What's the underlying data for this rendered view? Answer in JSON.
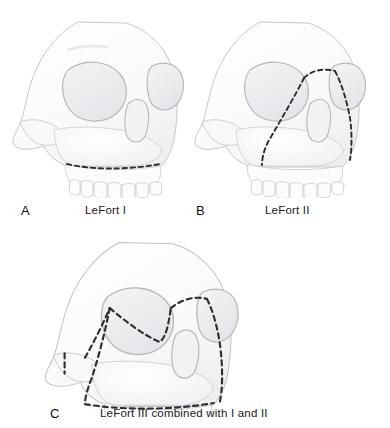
{
  "figure": {
    "background_color": "#ffffff",
    "bone_fill": "#fbfbfb",
    "bone_outline": "#b9bcbe",
    "shadow_color": "#e3e5e7",
    "fracture_line_color": "#2e2e2e",
    "label_color": "#111111"
  },
  "panels": [
    {
      "letter": "A",
      "caption": "LeFort I",
      "fracture_type": "LeFort I",
      "description": "Horizontal maxillary fracture above the alveolar ridge",
      "lines": [
        "horizontal-maxillary-line"
      ]
    },
    {
      "letter": "B",
      "caption": "LeFort II",
      "fracture_type": "LeFort II",
      "description": "Pyramidal fracture crossing the nasal bridge and descending through the maxilla",
      "lines": [
        "nasal-bridge-line",
        "left-pyramidal-limb",
        "right-pyramidal-limb"
      ]
    },
    {
      "letter": "C",
      "caption": "LeFort III combined with I and II",
      "fracture_type": "LeFort III",
      "description": "Craniofacial disjunction through the zygomatic arch and orbits, shown together with the LeFort I and II lines",
      "lines": [
        "zygomatic-arch-line",
        "lateral-orbital-line",
        "nasal-bridge-line",
        "medial-orbital-line",
        "horizontal-maxillary-line",
        "pyramidal-limb-line"
      ]
    }
  ]
}
